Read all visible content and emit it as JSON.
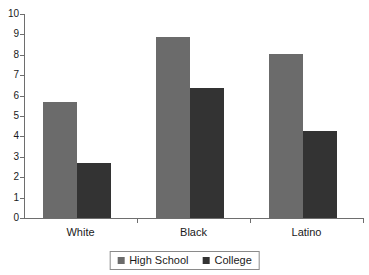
{
  "chart_data": {
    "type": "bar",
    "title": "",
    "xlabel": "",
    "ylabel": "",
    "categories": [
      "White",
      "Black",
      "Latino"
    ],
    "series": [
      {
        "name": "High School",
        "color": "#6b6b6b",
        "values": [
          5.7,
          8.85,
          8.05
        ]
      },
      {
        "name": "College",
        "color": "#333333",
        "values": [
          2.7,
          6.35,
          4.25
        ]
      }
    ],
    "ylim": [
      0,
      10
    ],
    "ytick_labels": [
      "0",
      "1",
      "2",
      "3",
      "4",
      "5",
      "6",
      "7",
      "8",
      "9",
      "10"
    ],
    "ytick_values": [
      0,
      1,
      2,
      3,
      4,
      5,
      6,
      7,
      8,
      9,
      10
    ],
    "grid": false,
    "legend_position": "bottom"
  },
  "legend": {
    "entries": [
      {
        "label": "High School"
      },
      {
        "label": "College"
      }
    ]
  },
  "colors": {
    "high_school": "#6b6b6b",
    "college": "#333333",
    "axis": "#6e6e6e",
    "text": "#1a1a1a",
    "background": "#ffffff"
  }
}
